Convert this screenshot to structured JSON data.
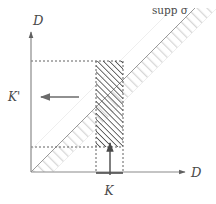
{
  "figure": {
    "title": "",
    "background_color": "#ffffff",
    "width": 216,
    "height": 204
  },
  "axes": {
    "x_axis_label": "D",
    "y_axis_label": "D",
    "origin": {
      "x": 31,
      "y": 172
    },
    "x_axis_end": {
      "x": 185,
      "y": 172
    },
    "y_axis_top": {
      "x": 31,
      "y": 30
    },
    "axis_color": "#8a8a8a",
    "arrowhead_color": "#555555"
  },
  "labels": {
    "supp_sigma": "supp σ",
    "y_tick_label": "K'",
    "x_tick_label": "K",
    "label_color": "#4a4a4a"
  },
  "band": {
    "name": "support-band",
    "description": "diagonal hatched band around the identity diagonal",
    "hatch_color": "#d9d9d9",
    "diagonal_line_color": "#8e8e8e",
    "half_width_px": 16
  },
  "hatched_region": {
    "name": "intersection-region",
    "x0": 96,
    "x1": 123,
    "y0": 61,
    "y1": 147,
    "hatch_color": "#3d3d3d",
    "border_style": "dotted",
    "border_color": "#555555"
  },
  "guides": {
    "upper_dotted_y": 61,
    "lower_dotted_y": 147,
    "left_dotted_x": 96,
    "right_dotted_x": 123,
    "dotted_color": "#4f4f4f"
  },
  "arrows": {
    "horizontal": {
      "name": "leftward-arrow",
      "direction": "left",
      "x_start": 79,
      "x_end": 40,
      "y": 97,
      "color": "#6b6b6b"
    },
    "vertical": {
      "name": "upward-arrow",
      "direction": "up",
      "x": 110,
      "y_start": 175,
      "y_end": 142,
      "color": "#555555"
    }
  },
  "x_tick_mark": {
    "name": "k-interval-tick",
    "x0": 96,
    "x1": 123,
    "y": 173,
    "color": "#4a4a4a"
  }
}
